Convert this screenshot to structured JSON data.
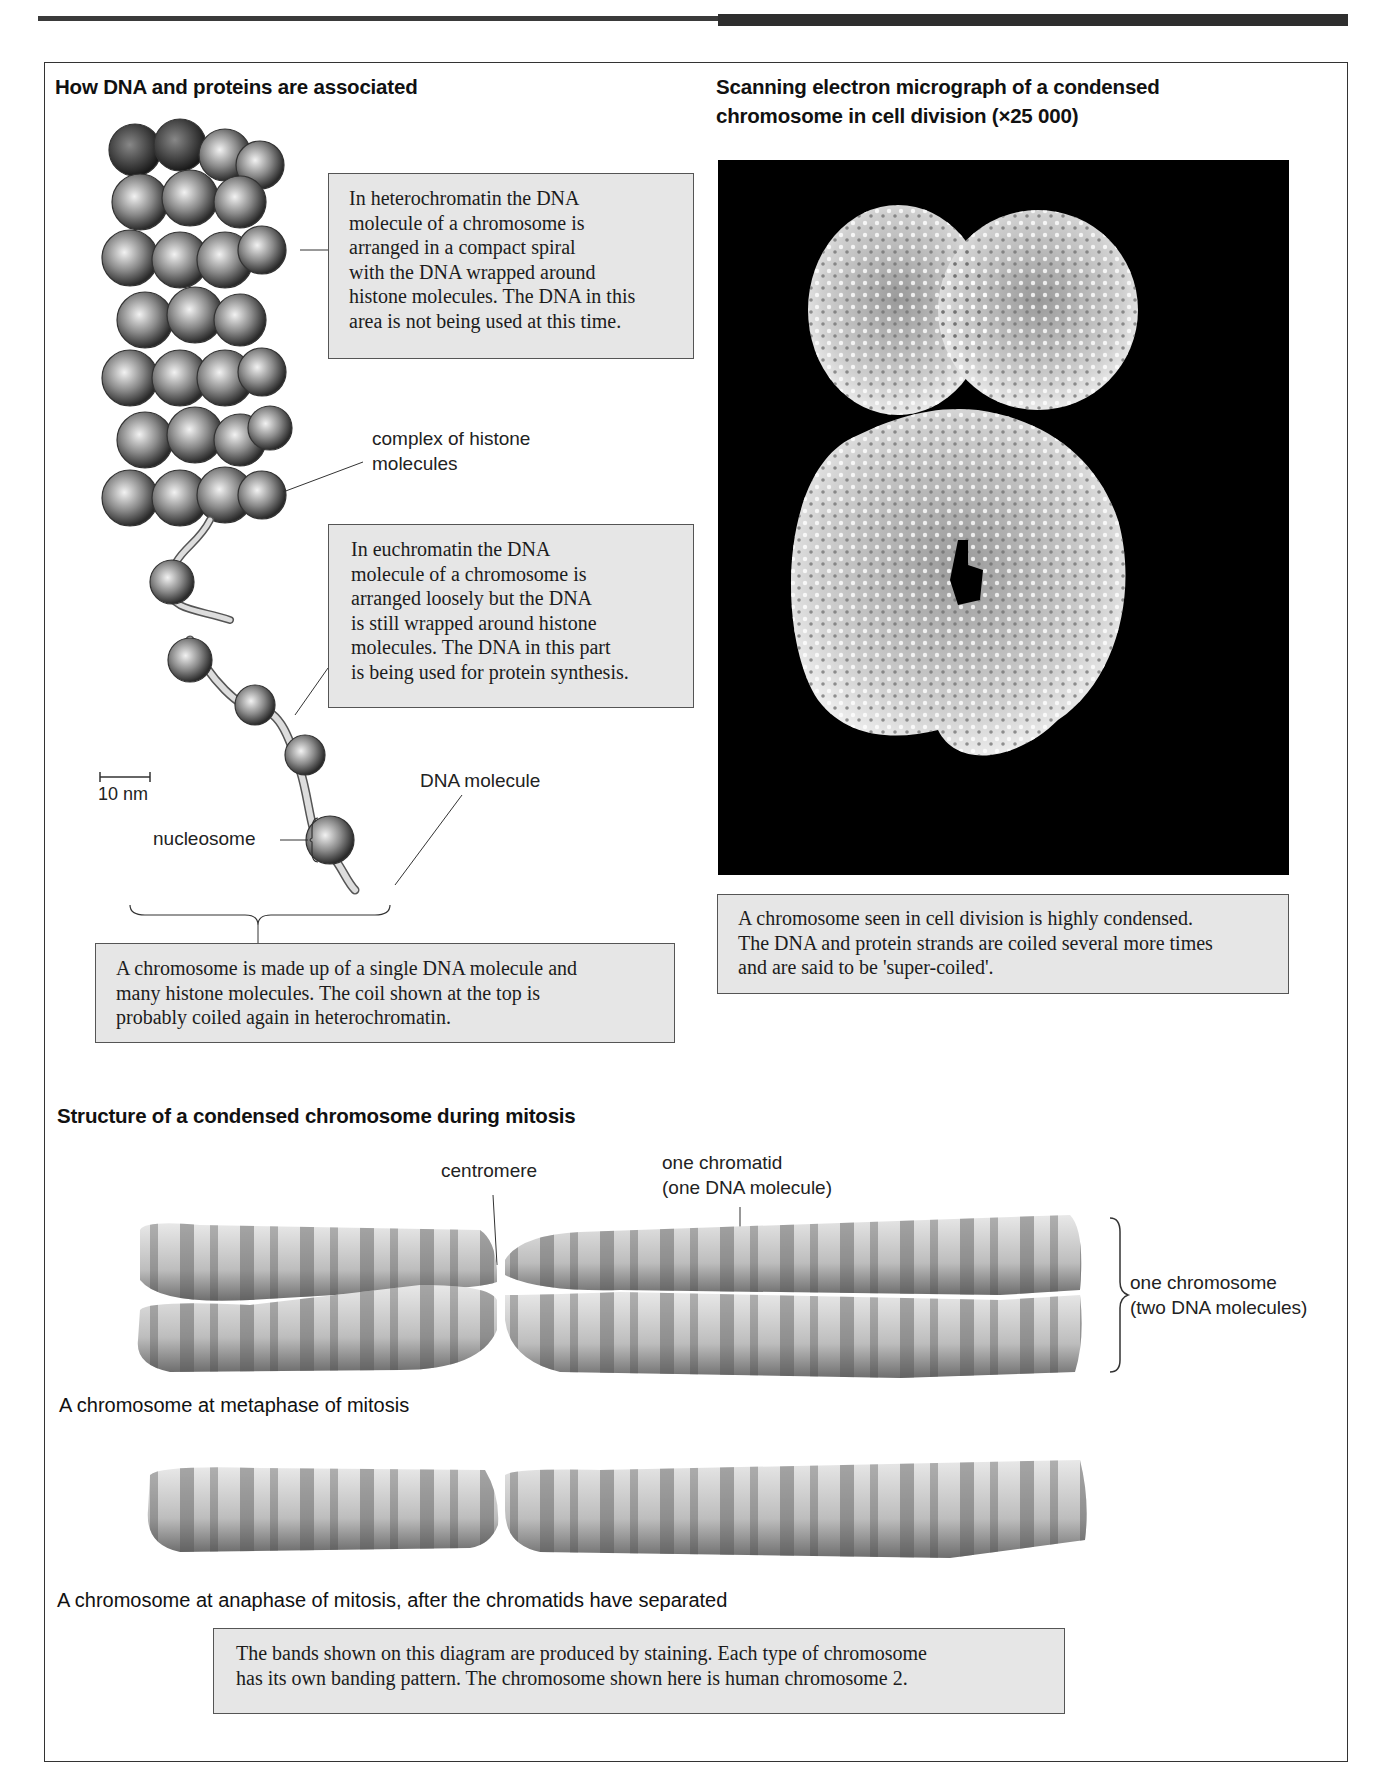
{
  "header_bars": {
    "left_color": "#3a3a3a",
    "right_color": "#2e2e2e"
  },
  "left_panel": {
    "title": "How DNA and proteins are associated",
    "heterochromatin_box": "In heterochromatin the DNA\nmolecule of a chromosome is\narranged in a compact spiral\nwith the DNA wrapped around\nhistone molecules. The DNA in this\narea is not being used at this time.",
    "histone_label": "complex of histone\nmolecules",
    "euchromatin_box": "In euchromatin the DNA\nmolecule of a chromosome is\narranged loosely but the DNA\nis still wrapped around histone\nmolecules. The DNA in this part\nis being used for protein synthesis.",
    "scale_bar_label": "10 nm",
    "dna_molecule_label": "DNA molecule",
    "nucleosome_label": "nucleosome",
    "summary_box": "A chromosome is made up of a single DNA molecule and\nmany histone molecules. The coil shown at the top is\nprobably coiled again in heterochromatin."
  },
  "right_panel": {
    "title": "Scanning electron micrograph of a condensed\nchromosome in cell division (×25 000)",
    "micrograph_alt": "Condensed chromosome micrograph",
    "caption_box": "A chromosome seen in cell division is highly condensed.\nThe DNA and protein strands are coiled several more times\nand are said to be 'super-coiled'."
  },
  "bottom_panel": {
    "title": "Structure of a condensed chromosome during mitosis",
    "centromere_label": "centromere",
    "chromatid_label": "one chromatid\n(one DNA molecule)",
    "chromosome_label": "one chromosome\n(two DNA molecules)",
    "metaphase_caption": "A chromosome at metaphase of mitosis",
    "anaphase_caption": "A chromosome at anaphase of mitosis, after the chromatids have separated",
    "banding_box": "The bands shown on this diagram are produced by staining. Each type of chromosome\nhas its own banding pattern. The chromosome shown here is human chromosome 2."
  }
}
